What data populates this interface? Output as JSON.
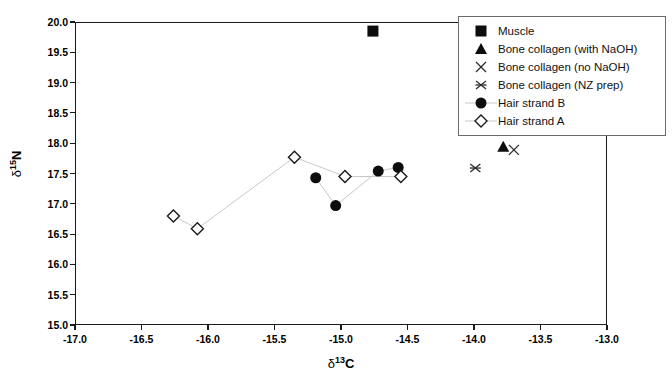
{
  "chart_data": {
    "type": "scatter",
    "title": "",
    "xlabel": "δ¹³C",
    "ylabel": "δ¹⁵N",
    "xlim": [
      -17.0,
      -13.0
    ],
    "ylim": [
      15.0,
      20.0
    ],
    "xticks": [
      "-17.0",
      "-16.5",
      "-16.0",
      "-15.5",
      "-15.0",
      "-14.5",
      "-14.0",
      "-13.5",
      "-13.0"
    ],
    "yticks": [
      "15.0",
      "15.5",
      "16.0",
      "16.5",
      "17.0",
      "17.5",
      "18.0",
      "18.5",
      "19.0",
      "19.5",
      "20.0"
    ],
    "grid": false,
    "legend_position": "top-right",
    "series": [
      {
        "name": "Muscle",
        "marker": "filled-square",
        "connected": false,
        "points": [
          {
            "x": -14.76,
            "y": 19.85
          }
        ]
      },
      {
        "name": "Bone collagen (with NaOH)",
        "marker": "filled-triangle",
        "connected": false,
        "points": [
          {
            "x": -13.78,
            "y": 17.94
          }
        ]
      },
      {
        "name": "Bone collagen (no NaOH)",
        "marker": "cross-x",
        "connected": false,
        "points": [
          {
            "x": -13.7,
            "y": 17.89
          }
        ]
      },
      {
        "name": "Bone collagen (NZ prep)",
        "marker": "asterisk",
        "connected": false,
        "points": [
          {
            "x": -13.99,
            "y": 17.59
          }
        ]
      },
      {
        "name": "Hair strand B",
        "marker": "filled-circle",
        "connected": true,
        "points": [
          {
            "x": -15.19,
            "y": 17.43
          },
          {
            "x": -15.04,
            "y": 16.97
          },
          {
            "x": -14.72,
            "y": 17.54
          },
          {
            "x": -14.57,
            "y": 17.6
          }
        ]
      },
      {
        "name": "Hair strand A",
        "marker": "open-diamond",
        "connected": true,
        "points": [
          {
            "x": -16.26,
            "y": 16.8
          },
          {
            "x": -16.08,
            "y": 16.59
          },
          {
            "x": -15.35,
            "y": 17.77
          },
          {
            "x": -14.97,
            "y": 17.45
          },
          {
            "x": -14.55,
            "y": 17.45
          }
        ]
      }
    ]
  },
  "axes": {
    "x_axis_label_delta": "δ",
    "x_axis_label_sup": "13",
    "x_axis_label_elem": "C",
    "y_axis_label_delta": "δ",
    "y_axis_label_sup": "15",
    "y_axis_label_elem": "N",
    "x_tick_0": "-17.0",
    "x_tick_1": "-16.5",
    "x_tick_2": "-16.0",
    "x_tick_3": "-15.5",
    "x_tick_4": "-15.0",
    "x_tick_5": "-14.5",
    "x_tick_6": "-14.0",
    "x_tick_7": "-13.5",
    "x_tick_8": "-13.0",
    "y_tick_0": "15.0",
    "y_tick_1": "15.5",
    "y_tick_2": "16.0",
    "y_tick_3": "16.5",
    "y_tick_4": "17.0",
    "y_tick_5": "17.5",
    "y_tick_6": "18.0",
    "y_tick_7": "18.5",
    "y_tick_8": "19.0",
    "y_tick_9": "19.5",
    "y_tick_10": "20.0"
  },
  "legend": {
    "items": [
      {
        "label": "Muscle",
        "marker": "filled-square",
        "line": false
      },
      {
        "label": "Bone collagen (with NaOH)",
        "marker": "filled-triangle",
        "line": false
      },
      {
        "label": "Bone collagen (no NaOH)",
        "marker": "cross-x",
        "line": false
      },
      {
        "label": "Bone collagen (NZ prep)",
        "marker": "asterisk",
        "line": false
      },
      {
        "label": "Hair strand B",
        "marker": "filled-circle",
        "line": true
      },
      {
        "label": "Hair strand A",
        "marker": "open-diamond",
        "line": true
      }
    ]
  },
  "colors": {
    "marker_fill": "#0d0d0d",
    "axis": "#1a1a1a",
    "connector_line": "#c8c8c8",
    "legend_border": "#6b6b6b",
    "background": "#ffffff"
  }
}
